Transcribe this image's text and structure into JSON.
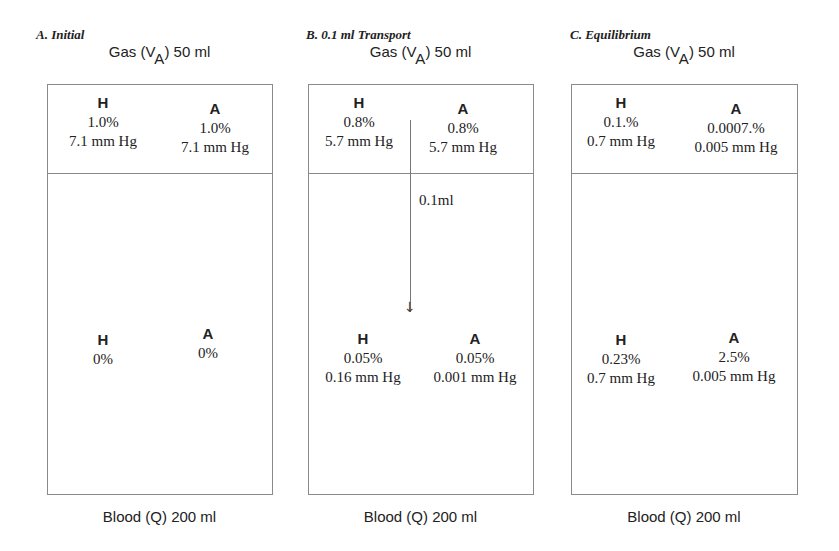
{
  "panels": [
    {
      "title": "A. Initial",
      "gas_label": "Gas (V",
      "gas_sub": "A",
      "gas_volume": ")  50 ml",
      "gas": {
        "H": {
          "symbol": "H",
          "percent": "1.0%",
          "pressure": "7.1 mm Hg"
        },
        "A": {
          "symbol": "A",
          "percent": "1.0%",
          "pressure": "7.1 mm Hg"
        }
      },
      "blood": {
        "H": {
          "symbol": "H",
          "percent": "0%",
          "pressure": ""
        },
        "A": {
          "symbol": "A",
          "percent": "0%",
          "pressure": ""
        }
      },
      "blood_label": "Blood (Q)  200 ml"
    },
    {
      "title": "B. 0.1 ml Transport",
      "gas_label": "Gas (V",
      "gas_sub": "A",
      "gas_volume": ")  50 ml",
      "gas": {
        "H": {
          "symbol": "H",
          "percent": "0.8%",
          "pressure": "5.7 mm Hg"
        },
        "A": {
          "symbol": "A",
          "percent": "0.8%",
          "pressure": "5.7 mm Hg"
        }
      },
      "transfer_label": "0.1ml",
      "blood": {
        "H": {
          "symbol": "H",
          "percent": "0.05%",
          "pressure": "0.16 mm Hg"
        },
        "A": {
          "symbol": "A",
          "percent": "0.05%",
          "pressure": "0.001 mm Hg"
        }
      },
      "blood_label": "Blood (Q)  200 ml"
    },
    {
      "title": "C. Equilibrium",
      "gas_label": "Gas (V",
      "gas_sub": "A",
      "gas_volume": ")  50 ml",
      "gas": {
        "H": {
          "symbol": "H",
          "percent": "0.1.%",
          "pressure": "0.7 mm Hg"
        },
        "A": {
          "symbol": "A",
          "percent": "0.0007.%",
          "pressure": "0.005 mm Hg"
        }
      },
      "blood": {
        "H": {
          "symbol": "H",
          "percent": "0.23%",
          "pressure": "0.7 mm Hg"
        },
        "A": {
          "symbol": "A",
          "percent": "2.5%",
          "pressure": "0.005 mm Hg"
        }
      },
      "blood_label": "Blood (Q)  200 ml"
    }
  ],
  "arrow": {
    "symbol": "↓",
    "direction": "gas-to-blood"
  }
}
